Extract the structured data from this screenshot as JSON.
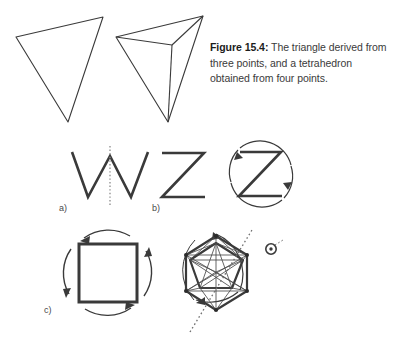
{
  "figure": {
    "number": "15.4",
    "caption_bold": "Figure 15.4:",
    "caption_text": " The triangle derived from three points, and a tetrahedron obtained from four points.",
    "caption_full": "Figure 15.4: The triangle derived from three points, and a tetrahedron obtained from four points."
  },
  "colors": {
    "background": "#ffffff",
    "ink": "#3a3a3a",
    "ink_dark": "#2b2b2b",
    "caption_text": "#3a3a3a",
    "caption_bold": "#1c1c1c"
  },
  "top_row": {
    "shapes": [
      {
        "name": "triangle",
        "label": "triangle derived from three points",
        "points": "16,37 103,17 68,122"
      },
      {
        "name": "tetrahedron",
        "label": "tetrahedron obtained from four points",
        "outer": "116,37 203,16 168,122",
        "apex": "172,45"
      }
    ]
  },
  "panels": [
    {
      "id": "a",
      "label": "a)",
      "glyph": "W",
      "symmetry": "mirror",
      "description": "letter W with dotted vertical mirror line"
    },
    {
      "id": "b",
      "label": "b)",
      "glyph": "Z",
      "symmetry": "two-fold rotation",
      "description": "letter Z plain, and letter Z enclosed in a circle of arrow arcs indicating 180 degree rotation"
    },
    {
      "id": "c",
      "label": "c)",
      "glyph": "square",
      "symmetry": "four-fold rotation",
      "description": "square enclosed by four arrow arcs indicating 90 degree rotation"
    },
    {
      "id": "d",
      "label": "",
      "glyph": "polyhedron",
      "symmetry": "rotation axis",
      "description": "icosahedral polyhedron with dotted rotation axis and encircling arrow arc"
    }
  ]
}
